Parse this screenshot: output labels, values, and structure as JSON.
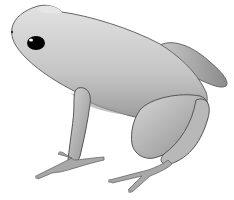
{
  "image": {
    "subject": "frog",
    "description": "Grayscale illustration of a small frog (poison dart frog style) seated facing left, side view, on white background",
    "colors": {
      "background": "#ffffff",
      "body_light": "#d9d9d9",
      "body_mid": "#b5b5b5",
      "body_dark": "#7a7a7a",
      "outline": "#555555",
      "eye": "#000000",
      "eye_highlight": "#ffffff"
    }
  }
}
